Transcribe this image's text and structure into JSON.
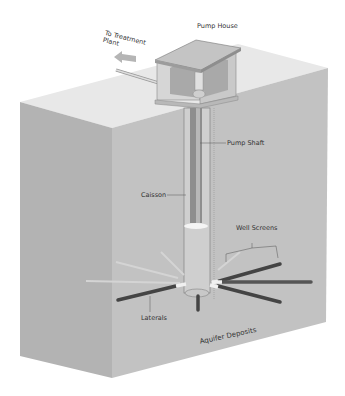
{
  "diagram": {
    "labels": {
      "pump_house": "Pump House",
      "to_treatment_line1": "To Treatment",
      "to_treatment_line2": "Plant",
      "pump_shaft": "Pump Shaft",
      "caisson": "Caisson",
      "well_screens": "Well Screens",
      "laterals": "Laterals",
      "aquifer": "Aquifer Deposits"
    },
    "colors": {
      "top_face": "#e6e6e6",
      "front_face": "#bdbdbd",
      "side_face": "#ababab",
      "lateral_dark": "#555555",
      "lateral_light": "#d0d0d0",
      "line": "#555555"
    }
  }
}
